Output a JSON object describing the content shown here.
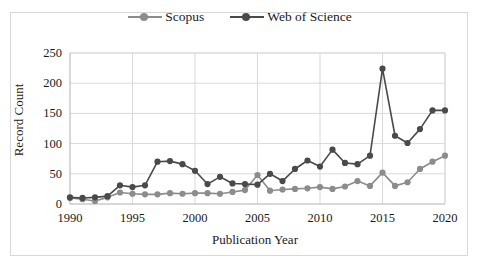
{
  "chart_data": {
    "type": "line",
    "title": "",
    "xlabel": "Publication Year",
    "ylabel": "Record Count",
    "xlim": [
      1990,
      2020
    ],
    "ylim": [
      0,
      250
    ],
    "yticks": [
      0,
      50,
      100,
      150,
      200,
      250
    ],
    "xticks": [
      1990,
      1995,
      2000,
      2005,
      2010,
      2015,
      2020
    ],
    "grid": "horizontal-and-vertical",
    "legend_position": "top-center",
    "x": [
      1990,
      1991,
      1992,
      1993,
      1994,
      1995,
      1996,
      1997,
      1998,
      1999,
      2000,
      2001,
      2002,
      2003,
      2004,
      2005,
      2006,
      2007,
      2008,
      2009,
      2010,
      2011,
      2012,
      2013,
      2014,
      2015,
      2016,
      2017,
      2018,
      2019,
      2020
    ],
    "series": [
      {
        "name": "Scopus",
        "color": "#8c8c8c",
        "values": [
          10,
          8,
          5,
          11,
          19,
          17,
          16,
          16,
          18,
          17,
          18,
          18,
          17,
          20,
          23,
          48,
          22,
          24,
          25,
          26,
          28,
          25,
          29,
          38,
          30,
          52,
          30,
          36,
          58,
          70,
          80
        ]
      },
      {
        "name": "Web of Science",
        "color": "#4a4a4a",
        "values": [
          11,
          10,
          11,
          13,
          31,
          28,
          31,
          70,
          71,
          66,
          55,
          33,
          45,
          34,
          33,
          32,
          50,
          38,
          58,
          72,
          62,
          90,
          68,
          66,
          80,
          224,
          113,
          101,
          124,
          155,
          155
        ]
      }
    ]
  },
  "legend": {
    "entries": [
      {
        "label": "Scopus",
        "color": "#8c8c8c"
      },
      {
        "label": "Web of Science",
        "color": "#4a4a4a"
      }
    ]
  },
  "axes": {
    "ylabel": "Record Count",
    "xlabel": "Publication Year",
    "ytick_labels": [
      "250",
      "200",
      "150",
      "100",
      "50",
      "0"
    ],
    "xtick_labels": [
      "1990",
      "1995",
      "2000",
      "2005",
      "2010",
      "2015",
      "2020"
    ]
  },
  "style": {
    "grid_color": "#d9d9d9",
    "axis_color": "#b0b0b0",
    "frame_color": "#d8d8d8",
    "background": "#ffffff"
  }
}
